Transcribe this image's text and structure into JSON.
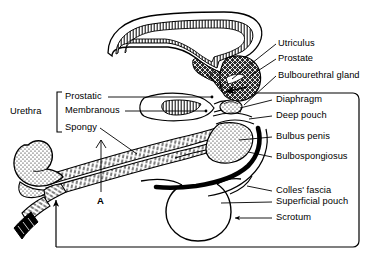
{
  "figure": {
    "panel_letter": "A",
    "ink_color": "#000000",
    "background_color": "#ffffff"
  },
  "bracket_groups": [
    {
      "name": "urethra",
      "label": "Urethra",
      "members": [
        "Prostatic",
        "Membranous",
        "Spongy"
      ]
    }
  ],
  "labels": {
    "urethra_group": "Urethra",
    "prostatic": "Prostatic",
    "membranous": "Membranous",
    "spongy": "Spongy",
    "utriculus": "Utriculus",
    "prostate": "Prostate",
    "bulbourethral_gland": "Bulbourethral gland",
    "diaphragm": "Diaphragm",
    "deep_pouch": "Deep pouch",
    "bulbus_penis": "Bulbus penis",
    "bulbospongiosus": "Bulbospongiosus",
    "colles_fascia": "Colles' fascia",
    "superficial_pouch": "Superficial pouch",
    "scrotum": "Scrotum",
    "panel_a": "A"
  },
  "structures": [
    {
      "name": "urinary-bladder",
      "fill": "hatched",
      "description": "Hook shaped bladder lumen with hatched wall lining at top of figure"
    },
    {
      "name": "prostate-gland",
      "fill": "cross-hatched-dark",
      "description": "Dark cross hatched mass surrounding prostatic urethra"
    },
    {
      "name": "prostatic-utricle",
      "fill": "cross-hatched-dark",
      "description": "Small dark wedge at the bladder neck"
    },
    {
      "name": "membranous-urethra",
      "fill": "hatched",
      "description": "Short hatched segment through the urogenital diaphragm"
    },
    {
      "name": "urogenital-diaphragm",
      "fill": "hatched",
      "description": "Band crossing beneath the prostate"
    },
    {
      "name": "bulbourethral-gland",
      "fill": "stippled",
      "description": "Small stippled nodule within the deep pouch"
    },
    {
      "name": "bulbus-penis",
      "fill": "stippled",
      "description": "Stippled bulb of the penis"
    },
    {
      "name": "bulbospongiosus-muscle",
      "fill": "solid-black",
      "description": "Thick black curved band over the bulb"
    },
    {
      "name": "corpus-spongiosum",
      "fill": "stippled",
      "description": "Long stippled tube forming shaft of penis"
    },
    {
      "name": "glans-penis",
      "fill": "stippled",
      "description": "Stippled mushroom shaped glans at left end"
    },
    {
      "name": "prepuce",
      "fill": "hatched",
      "description": "Hatched fold below the glans"
    },
    {
      "name": "scrotum",
      "fill": "outline",
      "description": "Oval outline below the perineum"
    },
    {
      "name": "colles-fascia",
      "fill": "line",
      "description": "Line bounding the superficial pouch and scrotum"
    },
    {
      "name": "enclosure-frame",
      "fill": "outline",
      "description": "Rounded rectangle frame with arrow indicating continuity of Colles' fascia"
    }
  ],
  "leader_lines": [
    {
      "for": "Utriculus",
      "from": "label-left",
      "to": "prostatic-utricle"
    },
    {
      "for": "Prostate",
      "from": "label-left",
      "to": "prostate-gland"
    },
    {
      "for": "Bulbourethral gland",
      "from": "label-left",
      "to": "bulbourethral-gland"
    },
    {
      "for": "Diaphragm",
      "from": "label-left",
      "to": "urogenital-diaphragm"
    },
    {
      "for": "Deep pouch",
      "from": "label-left",
      "to": "deep-pouch-space"
    },
    {
      "for": "Bulbus penis",
      "from": "label-left",
      "to": "bulbus-penis"
    },
    {
      "for": "Bulbospongiosus",
      "from": "label-left",
      "to": "bulbospongiosus-muscle"
    },
    {
      "for": "Colles' fascia",
      "from": "label-left",
      "to": "colles-fascia"
    },
    {
      "for": "Superficial pouch",
      "from": "label-left",
      "to": "superficial-pouch-space"
    },
    {
      "for": "Scrotum",
      "from": "label-left-arrow",
      "to": "scrotum"
    },
    {
      "for": "Prostatic",
      "from": "label-right",
      "to": "prostatic-urethra"
    },
    {
      "for": "Membranous",
      "from": "label-right",
      "to": "membranous-urethra"
    },
    {
      "for": "Spongy",
      "from": "label-right",
      "to": "corpus-spongiosum"
    },
    {
      "for": "A",
      "from": "label-top",
      "to": "corpus-spongiosum"
    }
  ]
}
